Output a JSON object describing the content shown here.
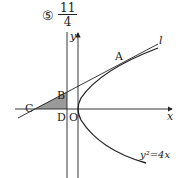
{
  "answer": {
    "choice_marker": "⑤",
    "fraction": {
      "numerator": "11",
      "denominator": "4"
    }
  },
  "diagram": {
    "axes": {
      "x_label": "x",
      "y_label": "y"
    },
    "curve_label": "y²=4x",
    "line_label": "l",
    "points": {
      "A": "A",
      "B": "B",
      "C": "C",
      "D": "D",
      "O": "O"
    },
    "colors": {
      "stroke": "#222222",
      "shade": "#9a9a9a"
    }
  }
}
